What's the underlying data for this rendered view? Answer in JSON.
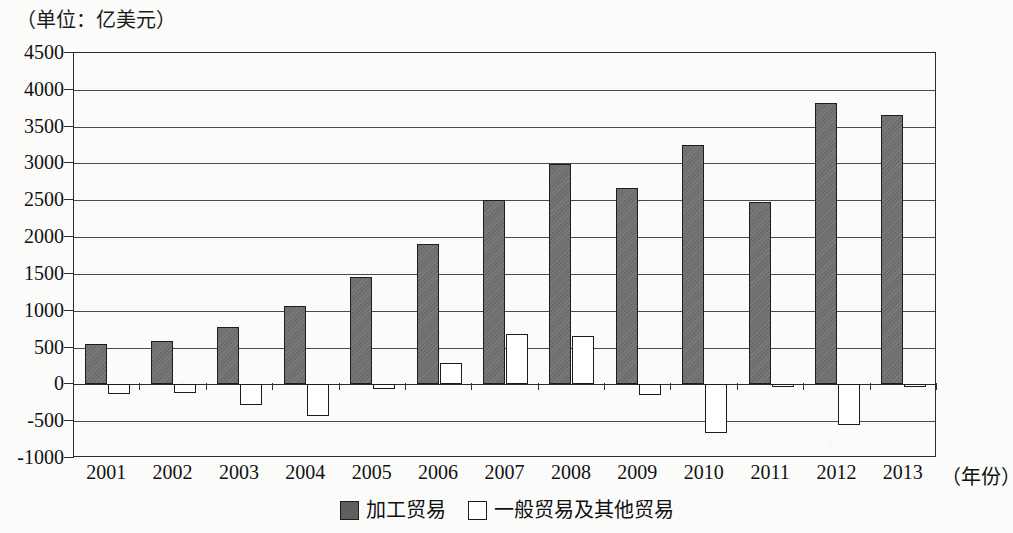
{
  "chart_data": {
    "type": "bar",
    "title": "",
    "unit_caption": "（单位：亿美元）",
    "xlabel": "（年份）",
    "ylabel": "",
    "categories": [
      "2001",
      "2002",
      "2003",
      "2004",
      "2005",
      "2006",
      "2007",
      "2008",
      "2009",
      "2010",
      "2011",
      "2012",
      "2013"
    ],
    "series": [
      {
        "name": "加工贸易",
        "color": "#6d6d6d",
        "values": [
          550,
          595,
          785,
          1070,
          1455,
          1905,
          2500,
          2990,
          2660,
          3250,
          2480,
          3825,
          3655
        ]
      },
      {
        "name": "一般贸易及其他贸易",
        "color": "#ffffff",
        "values": [
          -135,
          -120,
          -285,
          -430,
          -60,
          290,
          690,
          655,
          -150,
          -660,
          -25,
          -555,
          10
        ]
      }
    ],
    "ylim": [
      -1000,
      4500
    ],
    "yticks": [
      "4500",
      "4000",
      "3500",
      "3000",
      "2500",
      "2000",
      "1500",
      "1000",
      "500",
      "0",
      "-500",
      "-1000"
    ],
    "ytick_values": [
      4500,
      4000,
      3500,
      3000,
      2500,
      2000,
      1500,
      1000,
      500,
      0,
      -500,
      -1000
    ],
    "grid": true,
    "legend_position": "bottom"
  },
  "legend": {
    "entries": [
      {
        "label": "加工贸易",
        "swatch": "dark"
      },
      {
        "label": "一般贸易及其他贸易",
        "swatch": "light"
      }
    ]
  }
}
